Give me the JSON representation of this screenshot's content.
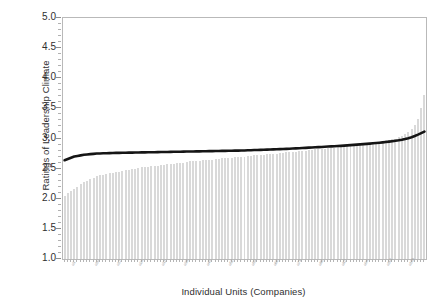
{
  "chart_data": {
    "type": "bar",
    "title": "",
    "xlabel": "Individual Units (Companies)",
    "ylabel": "Ratings of Leadership Climate",
    "ylim": [
      1.0,
      5.0
    ],
    "ytick_labels": [
      "5.0",
      "4.5",
      "4.0",
      "3.5",
      "3.0",
      "2.5",
      "2.0",
      "1.5",
      "1.0"
    ],
    "ytick_values": [
      5.0,
      4.5,
      4.0,
      3.5,
      3.0,
      2.5,
      2.0,
      1.5,
      1.0
    ],
    "minor_tick_step": 0.1,
    "grid": false,
    "legend": null,
    "bar_color": "#d9d9d9",
    "line_color": "#151515",
    "frame_color": "#b9b9b9",
    "n_units": 113,
    "categories_note": "Individual company units, sorted ascending by rating; axis tick labels are rotated unit codes rendered too small to read",
    "xtick_labels": [
      "u1",
      "u2",
      "u3",
      "u4",
      "u5",
      "u6",
      "u7",
      "u8",
      "u9",
      "u10",
      "u11",
      "u12",
      "u13",
      "u14",
      "u15",
      "u16",
      "u17",
      "u18",
      "u19",
      "u20",
      "u21",
      "u22",
      "u23",
      "u24",
      "u25",
      "u26",
      "u27",
      "u28",
      "u29",
      "u30",
      "u31",
      "u32",
      "u33",
      "u34",
      "u35",
      "u36",
      "u37",
      "u38",
      "u39",
      "u40",
      "u41",
      "u42",
      "u43",
      "u44",
      "u45",
      "u46",
      "u47",
      "u48",
      "u49",
      "u50",
      "u51",
      "u52",
      "u53",
      "u54",
      "u55",
      "u56",
      "u57",
      "u58",
      "u59",
      "u60",
      "u61",
      "u62",
      "u63",
      "u64",
      "u65",
      "u66",
      "u67",
      "u68",
      "u69",
      "u70",
      "u71",
      "u72",
      "u73",
      "u74",
      "u75",
      "u76",
      "u77",
      "u78",
      "u79",
      "u80",
      "u81",
      "u82",
      "u83",
      "u84",
      "u85",
      "u86",
      "u87",
      "u88",
      "u89",
      "u90",
      "u91",
      "u92",
      "u93",
      "u94",
      "u95",
      "u96",
      "u97",
      "u98",
      "u99",
      "u100",
      "u101",
      "u102",
      "u103",
      "u104",
      "u105",
      "u106",
      "u107",
      "u108",
      "u109",
      "u110",
      "u111",
      "u112",
      "u113"
    ],
    "series": [
      {
        "name": "Unit rating (bars)",
        "type": "bar",
        "values": [
          2.05,
          2.09,
          2.13,
          2.16,
          2.2,
          2.24,
          2.27,
          2.3,
          2.33,
          2.35,
          2.37,
          2.39,
          2.4,
          2.41,
          2.42,
          2.43,
          2.44,
          2.45,
          2.46,
          2.47,
          2.48,
          2.49,
          2.5,
          2.51,
          2.52,
          2.52,
          2.53,
          2.54,
          2.54,
          2.55,
          2.56,
          2.56,
          2.57,
          2.58,
          2.58,
          2.59,
          2.6,
          2.6,
          2.61,
          2.62,
          2.62,
          2.63,
          2.63,
          2.64,
          2.64,
          2.65,
          2.65,
          2.66,
          2.66,
          2.67,
          2.67,
          2.68,
          2.68,
          2.69,
          2.69,
          2.7,
          2.7,
          2.71,
          2.71,
          2.72,
          2.72,
          2.73,
          2.73,
          2.74,
          2.74,
          2.75,
          2.75,
          2.76,
          2.76,
          2.77,
          2.77,
          2.78,
          2.78,
          2.79,
          2.8,
          2.8,
          2.81,
          2.81,
          2.82,
          2.82,
          2.83,
          2.83,
          2.84,
          2.85,
          2.85,
          2.86,
          2.86,
          2.87,
          2.88,
          2.88,
          2.89,
          2.9,
          2.9,
          2.91,
          2.92,
          2.92,
          2.93,
          2.94,
          2.95,
          2.96,
          2.97,
          2.98,
          2.99,
          3.0,
          3.02,
          3.04,
          3.07,
          3.1,
          3.15,
          3.22,
          3.33,
          3.5,
          3.72
        ]
      },
      {
        "name": "Smoothed average (line)",
        "type": "line",
        "values": [
          2.64,
          2.66,
          2.68,
          2.7,
          2.71,
          2.72,
          2.73,
          2.735,
          2.74,
          2.745,
          2.75,
          2.752,
          2.754,
          2.756,
          2.758,
          2.76,
          2.761,
          2.762,
          2.763,
          2.764,
          2.765,
          2.766,
          2.767,
          2.768,
          2.769,
          2.77,
          2.771,
          2.772,
          2.773,
          2.774,
          2.775,
          2.776,
          2.777,
          2.778,
          2.779,
          2.78,
          2.781,
          2.782,
          2.783,
          2.784,
          2.785,
          2.786,
          2.787,
          2.788,
          2.789,
          2.79,
          2.791,
          2.792,
          2.793,
          2.794,
          2.795,
          2.796,
          2.797,
          2.798,
          2.799,
          2.8,
          2.802,
          2.804,
          2.806,
          2.808,
          2.81,
          2.812,
          2.814,
          2.816,
          2.818,
          2.82,
          2.822,
          2.824,
          2.826,
          2.828,
          2.83,
          2.833,
          2.836,
          2.839,
          2.842,
          2.845,
          2.848,
          2.851,
          2.854,
          2.857,
          2.86,
          2.863,
          2.866,
          2.869,
          2.872,
          2.875,
          2.878,
          2.882,
          2.886,
          2.89,
          2.894,
          2.898,
          2.902,
          2.906,
          2.91,
          2.915,
          2.92,
          2.925,
          2.93,
          2.936,
          2.942,
          2.948,
          2.955,
          2.962,
          2.97,
          2.98,
          2.992,
          3.006,
          3.022,
          3.042,
          3.065,
          3.09,
          3.115
        ]
      }
    ]
  }
}
